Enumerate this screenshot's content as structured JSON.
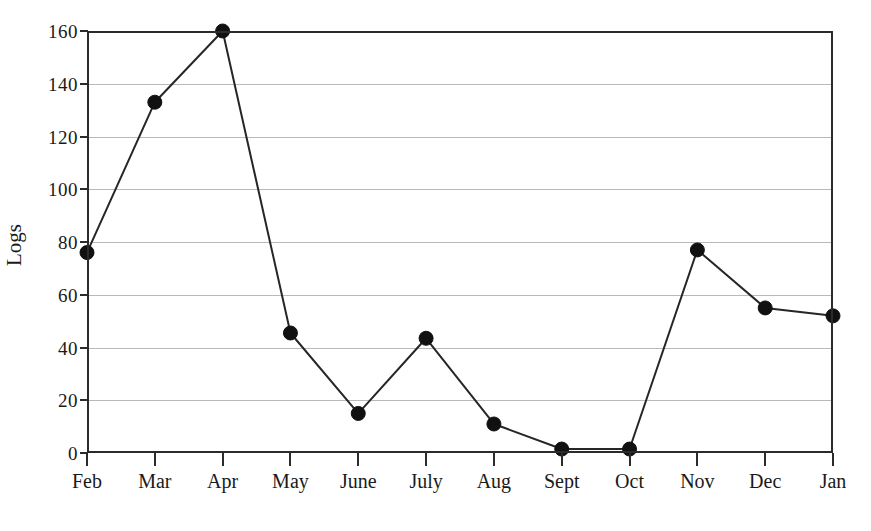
{
  "chart_data": {
    "type": "line",
    "title": "",
    "xlabel": "",
    "ylabel": "Logs",
    "categories": [
      "Feb",
      "Mar",
      "Apr",
      "May",
      "June",
      "July",
      "Aug",
      "Sept",
      "Oct",
      "Nov",
      "Dec",
      "Jan"
    ],
    "values": [
      76,
      133,
      160,
      45.5,
      15,
      43.5,
      11,
      1.5,
      1.5,
      77,
      55,
      52
    ],
    "series": [
      {
        "name": "Logs",
        "values": [
          76,
          133,
          160,
          45.5,
          15,
          43.5,
          11,
          1.5,
          1.5,
          77,
          55,
          52
        ]
      }
    ],
    "ylim": [
      0,
      160
    ],
    "yticks": [
      0,
      20,
      40,
      60,
      80,
      100,
      120,
      140,
      160
    ],
    "ytick_labels": [
      "0",
      "20",
      "40",
      "60",
      "80",
      "100",
      "120",
      "140",
      "160"
    ],
    "xtick_labels": [
      "Feb",
      "Mar",
      "Apr",
      "May",
      "June",
      "July",
      "Aug",
      "Sept",
      "Oct",
      "Nov",
      "Dec",
      "Jan"
    ],
    "grid": true,
    "grid_axis": "y",
    "legend": false,
    "legend_position": "none",
    "marker": "filled-circle",
    "line_color": "#262626",
    "marker_color": "#111111",
    "grid_color": "#b9b9b9",
    "axis_color": "#2b2b2b",
    "background_color": "#ffffff"
  }
}
